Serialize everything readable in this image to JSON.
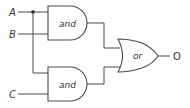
{
  "diagram": {
    "type": "logic-circuit",
    "inputs": [
      {
        "id": "A",
        "label": "A"
      },
      {
        "id": "B",
        "label": "B"
      },
      {
        "id": "C",
        "label": "C"
      }
    ],
    "gates": [
      {
        "id": "and1",
        "label": "and",
        "type": "AND",
        "inputs": [
          "A",
          "B"
        ]
      },
      {
        "id": "and2",
        "label": "and",
        "type": "AND",
        "inputs": [
          "A",
          "C"
        ]
      },
      {
        "id": "or1",
        "label": "or",
        "type": "OR",
        "inputs": [
          "and1",
          "and2"
        ]
      }
    ],
    "output": {
      "id": "O",
      "label": "O",
      "source": "or1"
    },
    "colors": {
      "line": "#4a4a4a",
      "text": "#333333",
      "background": "#ffffff"
    }
  }
}
